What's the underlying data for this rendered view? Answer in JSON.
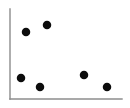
{
  "chart_data": {
    "type": "scatter",
    "title": "",
    "subtitle": "",
    "xlabel": "",
    "ylabel": "",
    "xlim": [
      0,
      100
    ],
    "ylim": [
      0,
      100
    ],
    "grid": false,
    "legend": null,
    "legend_position": "none",
    "xticks": [],
    "yticks": [],
    "xtick_labels": [],
    "ytick_labels": [],
    "annotations": [],
    "marker": {
      "shape": "circle",
      "color": "#0c0c0c",
      "diameter_px": 8.5
    },
    "axes": {
      "color": "#8c8c8c",
      "width_px": 1.4,
      "x_axis": {
        "x1": 10,
        "y1": 99,
        "x2": 122,
        "y2": 99
      },
      "y_axis": {
        "x1": 10,
        "y1": 9,
        "x2": 10,
        "y2": 99
      }
    },
    "series": [
      {
        "name": "",
        "color": "#0c0c0c",
        "points": [
          {
            "px": 26,
            "py": 32,
            "x": 14,
            "y": 74
          },
          {
            "px": 47,
            "py": 25,
            "x": 33,
            "y": 82
          },
          {
            "px": 21,
            "py": 78,
            "x": 10,
            "y": 23
          },
          {
            "px": 40,
            "py": 87,
            "x": 27,
            "y": 13
          },
          {
            "px": 84,
            "py": 75,
            "x": 66,
            "y": 27
          },
          {
            "px": 107,
            "py": 87,
            "x": 87,
            "y": 13
          }
        ]
      }
    ],
    "x": [
      14,
      33,
      10,
      27,
      66,
      87
    ],
    "values": [
      74,
      82,
      23,
      13,
      27,
      13
    ],
    "point_count": 6
  },
  "figure": {
    "width": 130,
    "height": 108,
    "background": "#ffffff"
  }
}
